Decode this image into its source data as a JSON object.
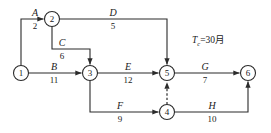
{
  "diagram": {
    "type": "network-cpm-pert",
    "title_note": {
      "symbol": "T",
      "subscript": "c",
      "equals_value": "=30月",
      "full_text": "Tc=30月"
    },
    "nodes": [
      {
        "id": "n1",
        "label": "1",
        "x": 21,
        "y": 73,
        "r": 7.5
      },
      {
        "id": "n2",
        "label": "2",
        "x": 52,
        "y": 19,
        "r": 7.5
      },
      {
        "id": "n3",
        "label": "3",
        "x": 90,
        "y": 73,
        "r": 7.5
      },
      {
        "id": "n4",
        "label": "4",
        "x": 167,
        "y": 112,
        "r": 7.5
      },
      {
        "id": "n5",
        "label": "5",
        "x": 167,
        "y": 73,
        "r": 7.5
      },
      {
        "id": "n6",
        "label": "6",
        "x": 248,
        "y": 73,
        "r": 7.5
      }
    ],
    "activities": [
      {
        "id": "A",
        "name": "A",
        "duration": "2",
        "from": "1",
        "to": "2",
        "style": "solid"
      },
      {
        "id": "B",
        "name": "B",
        "duration": "11",
        "from": "1",
        "to": "3",
        "style": "solid"
      },
      {
        "id": "C",
        "name": "C",
        "duration": "6",
        "from": "2",
        "to": "3",
        "style": "solid"
      },
      {
        "id": "D",
        "name": "D",
        "duration": "5",
        "from": "2",
        "to": "5",
        "style": "solid"
      },
      {
        "id": "E",
        "name": "E",
        "duration": "12",
        "from": "3",
        "to": "5",
        "style": "solid"
      },
      {
        "id": "F",
        "name": "F",
        "duration": "9",
        "from": "3",
        "to": "4",
        "style": "solid"
      },
      {
        "id": "G",
        "name": "G",
        "duration": "7",
        "from": "5",
        "to": "6",
        "style": "solid"
      },
      {
        "id": "H",
        "name": "H",
        "duration": "10",
        "from": "4",
        "to": "6",
        "style": "solid"
      }
    ],
    "dummy_activities": [
      {
        "id": "dummy-4-5",
        "from": "4",
        "to": "5",
        "style": "dashed",
        "name": "",
        "duration": ""
      }
    ],
    "colors": {
      "stroke": "#2b2b2b",
      "text": "#1a1a1a",
      "background": "#ffffff"
    }
  }
}
